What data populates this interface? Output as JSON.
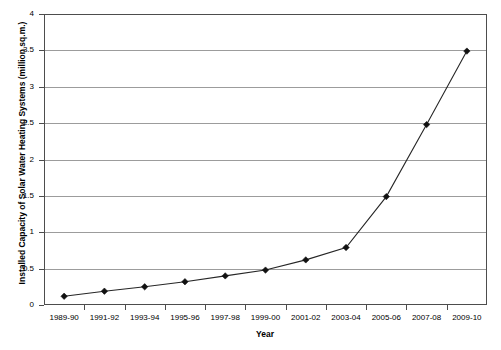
{
  "chart_data": {
    "type": "line",
    "title": "",
    "xlabel": "Year",
    "ylabel": "Installed Capacity of Solar Water Heating Systems (million sq.m.)",
    "categories": [
      "1989-90",
      "1991-92",
      "1993-94",
      "1995-96",
      "1997-98",
      "1999-00",
      "2001-02",
      "2003-04",
      "2005-06",
      "2007-08",
      "2009-10"
    ],
    "values": [
      0.12,
      0.19,
      0.25,
      0.32,
      0.4,
      0.48,
      0.62,
      0.79,
      1.49,
      2.48,
      3.49
    ],
    "series": [
      {
        "name": "Installed Capacity of Solar Water Heating Systems",
        "values": [
          0.12,
          0.19,
          0.25,
          0.32,
          0.4,
          0.48,
          0.62,
          0.79,
          1.49,
          2.48,
          3.49
        ]
      }
    ],
    "ylim": [
      0,
      4
    ],
    "y_ticks": [
      "0",
      "0.5",
      "1",
      "1.5",
      "2",
      "2.5",
      "3",
      "3.5",
      "4"
    ],
    "y_tick_values": [
      0,
      0.5,
      1,
      1.5,
      2,
      2.5,
      3,
      3.5,
      4
    ],
    "grid": true,
    "legend": "none",
    "marker": "diamond",
    "line_color": "#262626",
    "marker_color": "#111111",
    "grid_color": "#9c9c9c",
    "axis_color": "#4d4d4d",
    "background_color": "#ffffff"
  },
  "axes": {
    "x_title": "Year",
    "y_title": "Installed Capacity of Solar Water Heating Systems (million sq.m.)"
  }
}
